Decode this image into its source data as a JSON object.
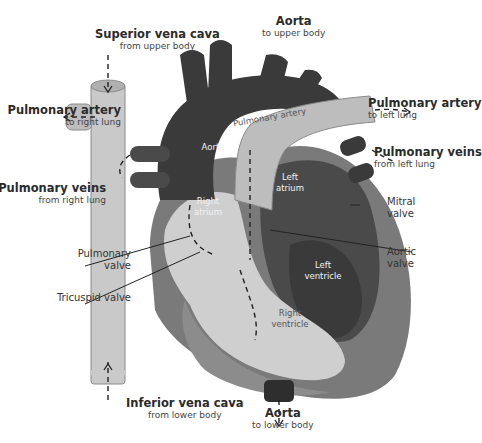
{
  "diagram": {
    "colors": {
      "background": "#ffffff",
      "aorta": "#3a3a3a",
      "vena_cava": "#c9c9c9",
      "pulmonary_artery": "#bdbdbd",
      "left_heart": "#4a4a4a",
      "right_heart_light": "#cfcfcf",
      "heart_wall": "#7a7a7a",
      "leader_line": "#222222"
    },
    "external_labels": {
      "superior_vena_cava": {
        "title": "Superior vena cava",
        "sub": "from upper body"
      },
      "aorta_top": {
        "title": "Aorta",
        "sub": "to upper body"
      },
      "pulmonary_artery_right": {
        "title": "Pulmonary artery",
        "sub": "to right lung"
      },
      "pulmonary_artery_left": {
        "title": "Pulmonary artery",
        "sub": "to left lung"
      },
      "pulmonary_veins_right": {
        "title": "Pulmonary veins",
        "sub": "from right lung"
      },
      "pulmonary_veins_left": {
        "title": "Pulmonary veins",
        "sub": "from left lung"
      },
      "mitral_valve": {
        "line1": "Mitral",
        "line2": "valve"
      },
      "aortic_valve": {
        "line1": "Aortic",
        "line2": "valve"
      },
      "pulmonary_valve": {
        "line1": "Pulmonary",
        "line2": "valve"
      },
      "tricuspid_valve": {
        "line1": "Tricuspid valve"
      },
      "inferior_vena_cava": {
        "title": "Inferior vena cava",
        "sub": "from lower body"
      },
      "aorta_bottom": {
        "title": "Aorta",
        "sub": "to lower body"
      }
    },
    "internal_labels": {
      "pulmonary_artery": "Pulmonary artery",
      "aorta": "Aorta",
      "left_atrium": [
        "Left",
        "atrium"
      ],
      "right_atrium": [
        "Right",
        "atrium"
      ],
      "left_ventricle": [
        "Left",
        "ventricle"
      ],
      "right_ventricle": [
        "Right",
        "ventricle"
      ]
    }
  }
}
